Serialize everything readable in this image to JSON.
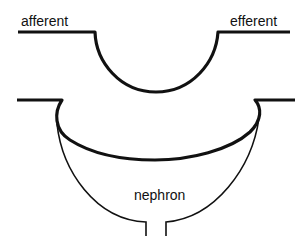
{
  "diagram": {
    "labels": {
      "afferent": "afferent",
      "efferent": "efferent",
      "nephron": "nephron"
    },
    "colors": {
      "stroke": "#111111",
      "background": "#ffffff"
    }
  }
}
